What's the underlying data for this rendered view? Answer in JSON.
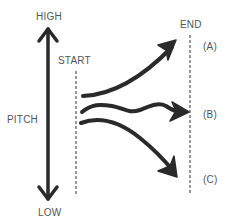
{
  "diagram": {
    "axis": {
      "high_label": "HIGH",
      "low_label": "LOW",
      "axis_label": "PITCH"
    },
    "start": {
      "label": "START"
    },
    "end": {
      "label": "END"
    },
    "outcomes": [
      {
        "id": "A",
        "label": "(A)",
        "shape": "rising curve"
      },
      {
        "id": "B",
        "label": "(B)",
        "shape": "wavy level"
      },
      {
        "id": "C",
        "label": "(C)",
        "shape": "falling curve"
      }
    ],
    "colors": {
      "arrow": "#2a2a2a",
      "text": "#555555",
      "dashed": "#555555",
      "background": "#ffffff"
    }
  }
}
